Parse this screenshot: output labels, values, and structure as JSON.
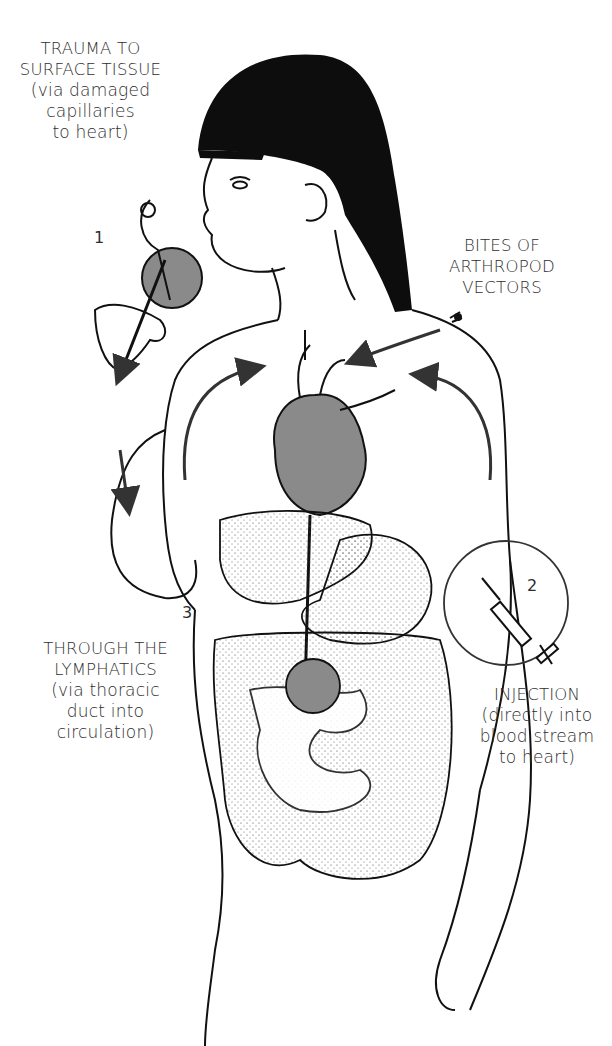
{
  "figure": {
    "highlight_color": "#8a8a8a",
    "ink_color": "#111111"
  },
  "labels": {
    "trauma": {
      "number": "1",
      "title_line1": "TRAUMA TO",
      "title_line2": "SURFACE TISSUE",
      "detail_line1": "(via damaged",
      "detail_line2": "capillaries",
      "detail_line3": "to heart)"
    },
    "bites": {
      "title_line1": "BITES OF",
      "title_line2": "ARTHROPOD",
      "title_line3": "VECTORS"
    },
    "injection": {
      "number": "2",
      "title_line1": "INJECTION",
      "detail_line1": "(directly into",
      "detail_line2": "blood stream",
      "detail_line3": "to heart)"
    },
    "lymphatics": {
      "number": "3",
      "title_line1": "THROUGH THE",
      "title_line2": "LYMPHATICS",
      "detail_line1": "(via thoracic",
      "detail_line2": "duct into",
      "detail_line3": "circulation)"
    }
  }
}
